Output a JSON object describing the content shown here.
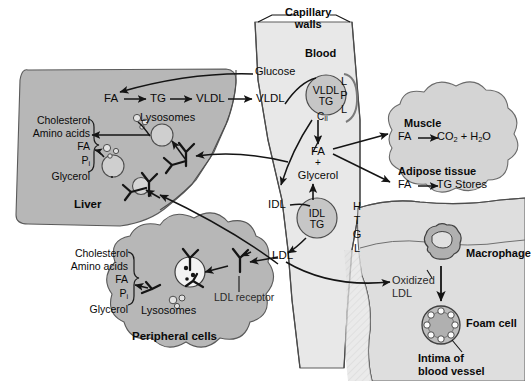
{
  "diagram": {
    "colors": {
      "background": "#ffffff",
      "liver_fill": "#b5b5b5",
      "peripheral_fill": "#b5b5b5",
      "capillary_fill": "#e6e6e6",
      "tissue_fill": "#d2d2d2",
      "vessel_fill": "#dcdcdc",
      "particle_fill": "#c9c9c9",
      "stroke": "#1a1a1a",
      "text": "#0a0a0a"
    }
  },
  "regions": {
    "capillary": {
      "label_line1": "Capillary",
      "label_line2": "walls"
    },
    "blood": {
      "label": "Blood"
    },
    "liver": {
      "label": "Liver"
    },
    "peripheral_cells": {
      "label": "Peripheral cells"
    },
    "muscle": {
      "label": "Muscle"
    },
    "adipose": {
      "label": "Adipose tissue"
    },
    "intima": {
      "label_line1": "Intima of",
      "label_line2": "blood vessel"
    }
  },
  "liver": {
    "pathway": {
      "fa": "FA",
      "tg": "TG",
      "vldl": "VLDL"
    },
    "lysosomes_label": "Lysosomes",
    "products": [
      "Cholesterol",
      "Amino acids",
      "FA",
      "Pi",
      "Glycerol"
    ],
    "products_display": {
      "cholesterol": "Cholesterol",
      "amino_acids": "Amino acids",
      "fa": "FA",
      "pi_base": "P",
      "pi_sub": "i",
      "glycerol": "Glycerol"
    }
  },
  "peripheral": {
    "lysosomes_label": "Lysosomes",
    "products_display": {
      "cholesterol": "Cholesterol",
      "amino_acids": "Amino acids",
      "fa": "FA",
      "pi_base": "P",
      "pi_sub": "i",
      "glycerol": "Glycerol"
    },
    "receptor_label": "LDL receptor"
  },
  "blood": {
    "glucose": "Glucose",
    "vldl_in": "VLDL",
    "vldl_particle": {
      "line1": "VLDL",
      "line2": "TG"
    },
    "apo_c2": {
      "base": "C",
      "sub": "II"
    },
    "lpl": {
      "letters": [
        "L",
        "P",
        "L"
      ],
      "name": "LPL"
    },
    "fa": "FA",
    "plus": "+",
    "glycerol": "Glycerol",
    "idl": "IDL",
    "idl_particle": {
      "line1": "IDL",
      "line2": "TG"
    },
    "htgl": {
      "letters": [
        "H",
        "T",
        "G",
        "L"
      ],
      "name": "HTGL"
    },
    "ldl": "LDL"
  },
  "tissues": {
    "muscle_reaction": {
      "substrate": "FA",
      "arrow": "→",
      "product_1_base": "CO",
      "product_1_sub": "2",
      "plus": "+",
      "product_2_base": "H",
      "product_2_sub": "2",
      "product_2_tail": "O"
    },
    "adipose_reaction": {
      "substrate": "FA",
      "arrow": "→",
      "product": "TG Stores"
    }
  },
  "vessel": {
    "oxidized_line1": "Oxidized",
    "oxidized_line2": "LDL",
    "macrophage": "Macrophage",
    "foam_cell": "Foam cell"
  }
}
